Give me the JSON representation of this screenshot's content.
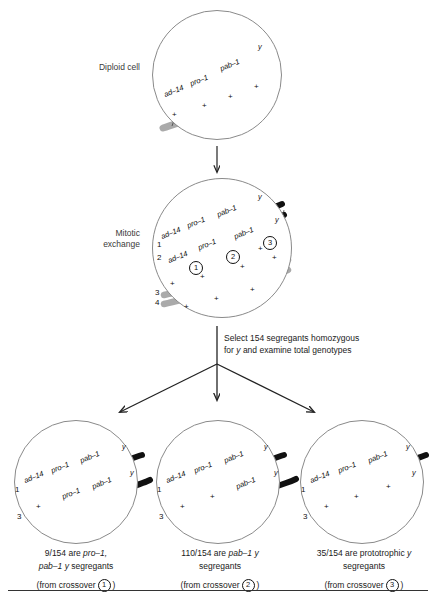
{
  "figure": {
    "bottom_rule": true
  },
  "stages": [
    {
      "id": "diploid",
      "label": "Diploid cell"
    },
    {
      "id": "mitotic",
      "label": "Mitotic\nexchange"
    }
  ],
  "genes": {
    "ad14": "ad–14",
    "pro1": "pro–1",
    "pab1": "pab–1",
    "y": "y",
    "plus": "+"
  },
  "diploid_cell": {
    "name": "Diploid cell",
    "chromatids": [
      {
        "color": "#111111",
        "markers": [
          "ad–14",
          "pro–1",
          "pab–1",
          "y"
        ]
      },
      {
        "color": "#aaaaaa",
        "markers": [
          "+",
          "+",
          "+",
          "+"
        ]
      }
    ]
  },
  "mitotic_cell": {
    "name": "Mitotic exchange",
    "strand_numbers": [
      "1",
      "2",
      "3",
      "4"
    ],
    "crossover_numbers": [
      "1",
      "2",
      "3"
    ],
    "chromatids": [
      {
        "strand": "1",
        "color": "#111111",
        "markers": [
          "ad–14",
          "pro–1",
          "pab–1",
          "y"
        ]
      },
      {
        "strand": "2",
        "color": "#111111",
        "markers": [
          "ad–14",
          "pro–1",
          "pab–1",
          "y"
        ]
      },
      {
        "strand": "3",
        "color": "#aaaaaa",
        "markers": [
          "+",
          "+",
          "+",
          "+"
        ]
      },
      {
        "strand": "4",
        "color": "#aaaaaa",
        "markers": [
          "+",
          "+",
          "+",
          "+"
        ]
      }
    ]
  },
  "select_note": {
    "line1_pre": "Select 154 segregants homozygous",
    "line2_pre": "for ",
    "line2_italic": "y",
    "line2_post": " and examine total genotypes"
  },
  "results": [
    {
      "id": "result-1",
      "crossover": "1",
      "strand_numbers": [
        "1",
        "3"
      ],
      "chromatids": [
        {
          "strand": "1",
          "segments": [
            {
              "color": "#111111"
            }
          ],
          "markers": [
            "ad–14",
            "pro–1",
            "pab–1",
            "y"
          ]
        },
        {
          "strand": "3",
          "segments": [
            {
              "color": "#aaaaaa"
            },
            {
              "color": "#111111"
            }
          ],
          "markers": [
            "+",
            "pro–1",
            "pab–1",
            "y"
          ]
        }
      ],
      "caption_count": "9/154",
      "caption_line1_pre": "9/154 are ",
      "caption_line1_italic": "pro–1,",
      "caption_line2_italic": "pab–1 y",
      "caption_line2_post": " segregants",
      "caption_from": "(from crossover",
      "caption_from_close": ")"
    },
    {
      "id": "result-2",
      "crossover": "2",
      "strand_numbers": [
        "1",
        "3"
      ],
      "chromatids": [
        {
          "strand": "1",
          "segments": [
            {
              "color": "#111111"
            }
          ],
          "markers": [
            "ad–14",
            "pro–1",
            "pab–1",
            "y"
          ]
        },
        {
          "strand": "3",
          "segments": [
            {
              "color": "#aaaaaa"
            },
            {
              "color": "#111111"
            }
          ],
          "markers": [
            "+",
            "+",
            "pab–1",
            "y"
          ]
        }
      ],
      "caption_count": "110/154",
      "caption_line1_pre": "110/154 are ",
      "caption_line1_italic": "pab–1 y",
      "caption_line2_post": "segregants",
      "caption_from": "(from crossover",
      "caption_from_close": ")"
    },
    {
      "id": "result-3",
      "crossover": "3",
      "strand_numbers": [
        "1",
        "3"
      ],
      "chromatids": [
        {
          "strand": "1",
          "segments": [
            {
              "color": "#111111"
            }
          ],
          "markers": [
            "ad–14",
            "pro–1",
            "pab–1",
            "y"
          ]
        },
        {
          "strand": "3",
          "segments": [
            {
              "color": "#aaaaaa"
            },
            {
              "color": "#111111"
            }
          ],
          "markers": [
            "+",
            "+",
            "+",
            "y"
          ]
        }
      ],
      "caption_count": "35/154",
      "caption_line1_pre": "35/154 are prototrophic ",
      "caption_line1_italic": "y",
      "caption_line2_post": "segregants",
      "caption_from": "(from crossover",
      "caption_from_close": ")"
    }
  ],
  "colors": {
    "mutant_chromatid": "#111111",
    "wildtype_chromatid": "#aaaaaa",
    "circle_outline": "#8a8a8a",
    "arrow": "#222222",
    "text": "#1a1a1a"
  }
}
